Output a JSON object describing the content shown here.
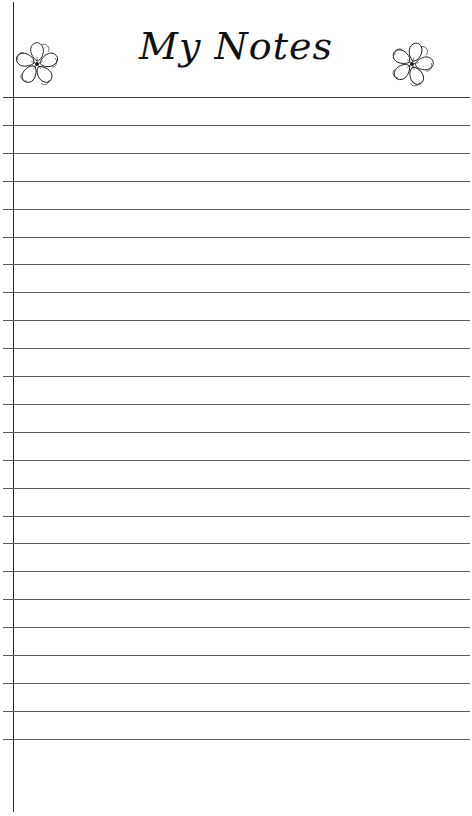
{
  "page": {
    "title": "My Notes",
    "line_count": 24,
    "first_line_y": 97,
    "line_spacing": 27.9,
    "colors": {
      "background": "#ffffff",
      "ink": "#111111",
      "rule": "#5a5a5a",
      "margin_line": "#2a2a2a"
    }
  },
  "decorations": {
    "left_icon": "flower-icon",
    "right_icon": "flower-icon"
  }
}
